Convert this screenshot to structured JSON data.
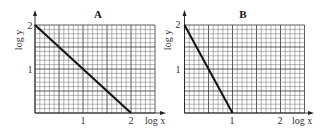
{
  "chart_data": [
    {
      "type": "line",
      "title": "A",
      "xlabel": "log x",
      "ylabel": "log y",
      "x_ticks": [
        "1",
        "2"
      ],
      "y_ticks": [
        "1",
        "2"
      ],
      "xlim": [
        0,
        2.5
      ],
      "ylim": [
        0,
        2
      ],
      "grid": true,
      "series": [
        {
          "name": "A",
          "x": [
            0,
            2
          ],
          "y": [
            2,
            0
          ]
        }
      ]
    },
    {
      "type": "line",
      "title": "B",
      "xlabel": "log x",
      "ylabel": "log y",
      "x_ticks": [
        "1",
        "2"
      ],
      "y_ticks": [
        "1",
        "2"
      ],
      "xlim": [
        0,
        2.5
      ],
      "ylim": [
        0,
        2
      ],
      "grid": true,
      "series": [
        {
          "name": "B",
          "x": [
            0,
            1
          ],
          "y": [
            2,
            0
          ]
        }
      ]
    }
  ],
  "panels": [
    {
      "title": "A",
      "xlabel": "log x",
      "ylabel": "log y",
      "xtick1": "1",
      "xtick2": "2",
      "ytick1": "1",
      "ytick2": "2"
    },
    {
      "title": "B",
      "xlabel": "log x",
      "ylabel": "log y",
      "xtick1": "1",
      "xtick2": "2",
      "ytick1": "1",
      "ytick2": "2"
    }
  ]
}
